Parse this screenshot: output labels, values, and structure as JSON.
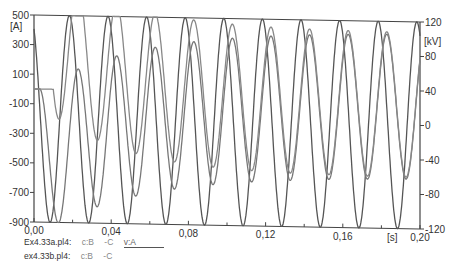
{
  "chart_data": {
    "type": "line",
    "title": "",
    "xlabel": "[s]",
    "ylabel_left": "[A]",
    "ylabel_right": "[kV]",
    "xlim": [
      0.0,
      0.2
    ],
    "ylim_left": [
      -900,
      500
    ],
    "ylim_right": [
      -120,
      120
    ],
    "x_ticks": [
      "0,00",
      "0,04",
      "0,08",
      "0,12",
      "0,16",
      "0,20"
    ],
    "x_tick_values": [
      0.0,
      0.04,
      0.08,
      0.12,
      0.16,
      0.2
    ],
    "y_left_ticks": [
      "500",
      "300",
      "100",
      "-100",
      "-300",
      "-500",
      "-700",
      "-900"
    ],
    "y_left_tick_values": [
      500,
      300,
      100,
      -100,
      -300,
      -500,
      -700,
      -900
    ],
    "y_right_ticks": [
      "120",
      "80",
      "40",
      "0",
      "-40",
      "-80",
      "-120"
    ],
    "y_right_tick_values": [
      120,
      80,
      40,
      0,
      -40,
      -80,
      -120
    ],
    "grid": false,
    "legend_position": "bottom-left",
    "series": [
      {
        "name": "Ex4.33a.pl4: v:A",
        "axis": "right",
        "kind": "sine",
        "amplitude_kV": 120,
        "frequency_hz": 50,
        "phase_deg": 120,
        "color": "#555555"
      },
      {
        "name": "Ex4.33a.pl4: c:B -C",
        "axis": "left",
        "kind": "switched-sine",
        "switch_time_s": 0.003,
        "amplitude_A": 490,
        "steady_offset_A": -65,
        "initial_dc_A": -380,
        "dc_decay_tau_s": 0.05,
        "frequency_hz": 50,
        "phase_deg": 40,
        "color": "#777777"
      },
      {
        "name": "ex4.33b.pl4: c:B -C",
        "axis": "left",
        "kind": "switched-sine",
        "switch_time_s": 0.01,
        "amplitude_A": 490,
        "steady_offset_A": -65,
        "initial_dc_A": 150,
        "dc_decay_tau_s": 0.04,
        "frequency_hz": 50,
        "phase_deg": 40,
        "color": "#888888"
      }
    ]
  },
  "legend": {
    "rows": [
      {
        "file": "Ex4.33a.pl4:",
        "signals": [
          "c:B",
          "-C"
        ],
        "voltage": "v:A"
      },
      {
        "file": "ex4.33b.pl4:",
        "signals": [
          "c:B",
          "-C"
        ]
      }
    ]
  }
}
